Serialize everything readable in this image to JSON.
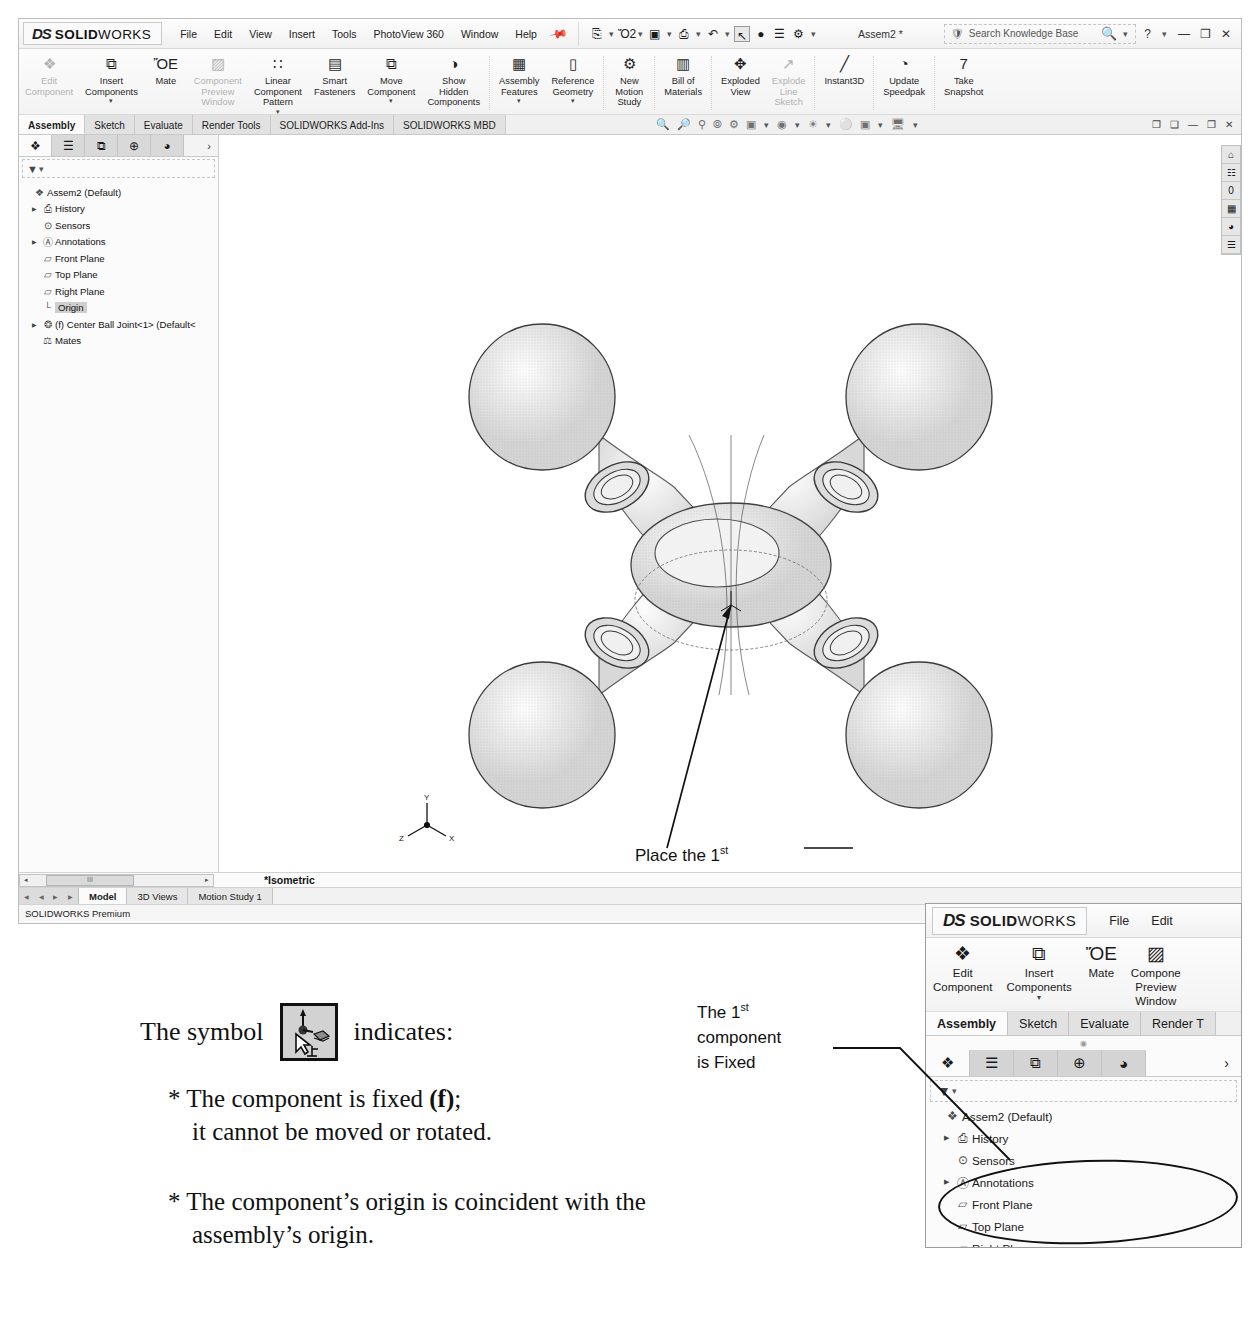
{
  "app": {
    "brand_ds": "DS",
    "brand_solid": "SOLID",
    "brand_works": "WORKS",
    "document_title": "Assem2 *",
    "status_text": "SOLIDWORKS Premium",
    "coordinates": "X: .000in Y: .000in Z: .000in",
    "view_orientation": "*Isometric"
  },
  "menu": {
    "items": [
      "File",
      "Edit",
      "View",
      "Insert",
      "Tools",
      "PhotoView 360",
      "Window",
      "Help"
    ],
    "pin_icon": "pushpin-icon"
  },
  "quick_access": {
    "items": [
      {
        "name": "new-document-icon",
        "glyph": "⎘"
      },
      {
        "name": "open-folder-icon",
        "glyph": "Ὄ2"
      },
      {
        "name": "save-icon",
        "glyph": "▣"
      },
      {
        "name": "print-icon",
        "glyph": "⎙"
      },
      {
        "name": "undo-icon",
        "glyph": "↶"
      },
      {
        "name": "select-cursor-icon",
        "glyph": "↖"
      },
      {
        "name": "measure-icon",
        "glyph": "●"
      },
      {
        "name": "options-list-icon",
        "glyph": "☰"
      },
      {
        "name": "settings-gear-icon",
        "glyph": "⚙"
      }
    ]
  },
  "search": {
    "placeholder": "Search Knowledge Base",
    "icon": "search-icon",
    "shield_icon": "knowledge-shield-icon"
  },
  "window_controls": {
    "help": "?",
    "minimize": "—",
    "restore": "❐",
    "close": "✕"
  },
  "ribbon": {
    "buttons": [
      {
        "label": "Edit\nComponent",
        "icon": "edit-component-icon",
        "glyph": "❖",
        "dim": true,
        "caret": false
      },
      {
        "label": "Insert\nComponents",
        "icon": "insert-components-icon",
        "glyph": "⧉",
        "dim": false,
        "caret": true
      },
      {
        "label": "Mate",
        "icon": "mate-icon",
        "glyph": "ὌE",
        "dim": false,
        "caret": false
      },
      {
        "label": "Component\nPreview\nWindow",
        "icon": "component-preview-window-icon",
        "glyph": "▨",
        "dim": true,
        "caret": false
      },
      {
        "label": "Linear\nComponent\nPattern",
        "icon": "linear-component-pattern-icon",
        "glyph": "∷",
        "dim": false,
        "caret": true
      },
      {
        "label": "Smart\nFasteners",
        "icon": "smart-fasteners-icon",
        "glyph": "▤",
        "dim": false,
        "caret": false
      },
      {
        "label": "Move\nComponent",
        "icon": "move-component-icon",
        "glyph": "⧉",
        "dim": false,
        "caret": true
      },
      {
        "label": "Show\nHidden\nComponents",
        "icon": "show-hidden-components-icon",
        "glyph": "◑",
        "dim": false,
        "caret": false
      },
      {
        "label": "Assembly\nFeatures",
        "icon": "assembly-features-icon",
        "glyph": "▦",
        "dim": false,
        "caret": true
      },
      {
        "label": "Reference\nGeometry",
        "icon": "reference-geometry-icon",
        "glyph": "▯",
        "dim": false,
        "caret": true
      },
      {
        "label": "New\nMotion\nStudy",
        "icon": "new-motion-study-icon",
        "glyph": "⚙",
        "dim": false,
        "caret": false
      },
      {
        "label": "Bill of\nMaterials",
        "icon": "bill-of-materials-icon",
        "glyph": "▥",
        "dim": false,
        "caret": false
      },
      {
        "label": "Exploded\nView",
        "icon": "exploded-view-icon",
        "glyph": "✥",
        "dim": false,
        "caret": false
      },
      {
        "label": "Explode\nLine\nSketch",
        "icon": "explode-line-sketch-icon",
        "glyph": "↗",
        "dim": true,
        "caret": false
      },
      {
        "label": "Instant3D",
        "icon": "instant3d-icon",
        "glyph": "╱",
        "dim": false,
        "caret": false
      },
      {
        "label": "Update\nSpeedpak",
        "icon": "update-speedpak-icon",
        "glyph": "◔",
        "dim": false,
        "caret": false
      },
      {
        "label": "Take\nSnapshot",
        "icon": "take-snapshot-icon",
        "glyph": "὏7",
        "dim": false,
        "caret": false
      }
    ]
  },
  "tabs": {
    "items": [
      "Assembly",
      "Sketch",
      "Evaluate",
      "Render Tools",
      "SOLIDWORKS Add-Ins",
      "SOLIDWORKS MBD"
    ],
    "active": "Assembly"
  },
  "view_toolbar": {
    "icons": [
      "zoom-to-fit-icon",
      "zoom-to-area-icon",
      "zoom-in-out-icon",
      "rotate-view-icon",
      "pan-icon",
      "view-orientation-icon",
      "display-style-icon",
      "hide-show-icon",
      "appearances-icon",
      "apply-scene-icon",
      "view-settings-icon"
    ]
  },
  "view_window_controls": {
    "items": [
      "❐",
      "❑",
      "—",
      "❐",
      "✕"
    ]
  },
  "tree_panel": {
    "tabs": [
      {
        "name": "feature-manager-tab",
        "glyph": "❖",
        "selected": true
      },
      {
        "name": "property-manager-tab",
        "glyph": "☰",
        "selected": false
      },
      {
        "name": "configuration-manager-tab",
        "glyph": "⧉",
        "selected": false
      },
      {
        "name": "dimxpert-manager-tab",
        "glyph": "⊕",
        "selected": false
      },
      {
        "name": "display-manager-tab",
        "glyph": "◕",
        "selected": false
      }
    ],
    "expand_arrow": "›",
    "filter_icon": "filter-funnel-icon",
    "nodes": [
      {
        "label": "Assem2  (Default<Display State-1>)",
        "icon": "assembly-icon",
        "glyph": "❖",
        "expand": false,
        "indent": 0,
        "selected": false
      },
      {
        "label": "History",
        "icon": "history-folder-icon",
        "glyph": "⎙",
        "expand": true,
        "indent": 1,
        "selected": false
      },
      {
        "label": "Sensors",
        "icon": "sensors-folder-icon",
        "glyph": "⊙",
        "expand": false,
        "indent": 1,
        "selected": false
      },
      {
        "label": "Annotations",
        "icon": "annotations-folder-icon",
        "glyph": "Ⓐ",
        "expand": true,
        "indent": 1,
        "selected": false
      },
      {
        "label": "Front Plane",
        "icon": "plane-icon",
        "glyph": "▱",
        "expand": false,
        "indent": 1,
        "selected": false
      },
      {
        "label": "Top Plane",
        "icon": "plane-icon",
        "glyph": "▱",
        "expand": false,
        "indent": 1,
        "selected": false
      },
      {
        "label": "Right Plane",
        "icon": "plane-icon",
        "glyph": "▱",
        "expand": false,
        "indent": 1,
        "selected": false
      },
      {
        "label": "Origin",
        "icon": "origin-icon",
        "glyph": "└",
        "expand": false,
        "indent": 1,
        "selected": true
      },
      {
        "label": "(f) Center Ball Joint<1> (Default<<D",
        "icon": "component-icon",
        "glyph": "❂",
        "expand": true,
        "indent": 1,
        "selected": false
      },
      {
        "label": "Mates",
        "icon": "mates-folder-icon",
        "glyph": "⚖",
        "expand": false,
        "indent": 1,
        "selected": false
      }
    ]
  },
  "right_toolbar": {
    "icons": [
      {
        "name": "home-icon",
        "glyph": "⌂"
      },
      {
        "name": "design-library-icon",
        "glyph": "☷"
      },
      {
        "name": "file-explorer-icon",
        "glyph": "὜0"
      },
      {
        "name": "view-palette-icon",
        "glyph": "▦"
      },
      {
        "name": "appearances-scenes-icon",
        "glyph": "◕"
      },
      {
        "name": "custom-properties-icon",
        "glyph": "☰"
      }
    ]
  },
  "viewport": {
    "annotation": {
      "line1_a": "Place the 1",
      "line1_sup": "st",
      "line2": "component",
      "line3": "on the origin"
    },
    "triad_labels": {
      "x": "X",
      "y": "Y",
      "z": "Z"
    },
    "origin_label": ""
  },
  "bottom": {
    "model_tabs": [
      "Model",
      "3D Views",
      "Motion Study 1"
    ],
    "active_model_tab": "Model",
    "scroll_left": "◂",
    "scroll_right": "▸",
    "thumb_label": "III"
  },
  "inset": {
    "brand_ds": "DS",
    "brand_solid": "SOLID",
    "brand_works": "WORKS",
    "menu": [
      "File",
      "Edit"
    ],
    "ribbon": [
      {
        "label": "Edit\nComponent",
        "icon": "edit-component-icon",
        "glyph": "❖",
        "caret": false
      },
      {
        "label": "Insert\nComponents",
        "icon": "insert-components-icon",
        "glyph": "⧉",
        "caret": true
      },
      {
        "label": "Mate",
        "icon": "mate-icon",
        "glyph": "ὌE",
        "caret": false
      },
      {
        "label": "Compone\nPreview\nWindow",
        "icon": "component-preview-window-icon",
        "glyph": "▨",
        "caret": false
      }
    ],
    "tabs": [
      "Assembly",
      "Sketch",
      "Evaluate",
      "Render T"
    ],
    "active_tab": "Assembly",
    "tree_tabs": [
      {
        "name": "feature-manager-tab",
        "glyph": "❖",
        "selected": true
      },
      {
        "name": "property-manager-tab",
        "glyph": "☰",
        "selected": false
      },
      {
        "name": "configuration-manager-tab",
        "glyph": "⧉",
        "selected": false
      },
      {
        "name": "dimxpert-manager-tab",
        "glyph": "⊕",
        "selected": false
      },
      {
        "name": "display-manager-tab",
        "glyph": "◕",
        "selected": false
      }
    ],
    "expand_arrow": "›",
    "filter_icon": "filter-funnel-icon",
    "nodes": [
      {
        "label": "Assem2  (Default<Display State-1>)",
        "glyph": "❖",
        "icon": "assembly-icon",
        "expand": false,
        "indent": 0,
        "selected": false
      },
      {
        "label": "History",
        "glyph": "⎙",
        "icon": "history-folder-icon",
        "expand": true,
        "indent": 1,
        "selected": false
      },
      {
        "label": "Sensors",
        "glyph": "⊙",
        "icon": "sensors-folder-icon",
        "expand": false,
        "indent": 1,
        "selected": false
      },
      {
        "label": "Annotations",
        "glyph": "Ⓐ",
        "icon": "annotations-folder-icon",
        "expand": true,
        "indent": 1,
        "selected": false
      },
      {
        "label": "Front Plane",
        "glyph": "▱",
        "icon": "plane-icon",
        "expand": false,
        "indent": 1,
        "selected": false
      },
      {
        "label": "Top Plane",
        "glyph": "▱",
        "icon": "plane-icon",
        "expand": false,
        "indent": 1,
        "selected": false
      },
      {
        "label": "Right Plane",
        "glyph": "▱",
        "icon": "plane-icon",
        "expand": false,
        "indent": 1,
        "selected": false
      },
      {
        "label": "Origin",
        "glyph": "└",
        "icon": "origin-icon",
        "expand": false,
        "indent": 1,
        "selected": false
      },
      {
        "label": "(f) Center Ball Joint<1> (Default<<D",
        "glyph": "❂",
        "icon": "component-icon",
        "expand": true,
        "indent": 1,
        "selected": true
      },
      {
        "label": "Mates",
        "glyph": "⚖",
        "icon": "mates-folder-icon",
        "expand": false,
        "indent": 1,
        "selected": false
      }
    ]
  },
  "callout_fixed": {
    "line1_a": "The 1",
    "line1_sup": "st",
    "line2": "component",
    "line3": "is Fixed"
  },
  "caption": {
    "symbol_lead": "The symbol",
    "symbol_trail": "indicates:",
    "symbol_icon": "fixed-component-cursor-icon",
    "bullet1_a": "* The component is fixed ",
    "bullet1_bold": "(f)",
    "bullet1_b": ";",
    "bullet1_line2": "it cannot be moved or rotated.",
    "bullet2_line1": "* The component’s origin is coincident with the",
    "bullet2_line2": "assembly’s origin."
  },
  "colors": {
    "window_chrome": "#f1f1f1",
    "selection_gray": "#cfcfcf",
    "border": "#bdbdbd",
    "text": "#1a1a1a"
  }
}
